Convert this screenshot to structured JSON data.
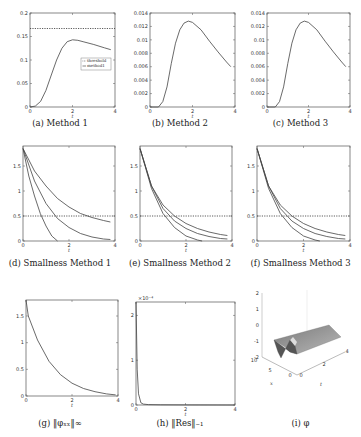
{
  "figure": {
    "panels": [
      {
        "id": "a",
        "caption": "(a) Method 1"
      },
      {
        "id": "b",
        "caption": "(b) Method 2"
      },
      {
        "id": "c",
        "caption": "(c) Method 3"
      },
      {
        "id": "d",
        "caption": "(d) Smallness Method 1"
      },
      {
        "id": "e",
        "caption": "(e) Smallness Method 2"
      },
      {
        "id": "f",
        "caption": "(f) Smallness Method 3"
      },
      {
        "id": "g",
        "caption": "(g) ‖φₓₓ‖∞"
      },
      {
        "id": "h",
        "caption": "(h) ‖Res‖₋₁"
      },
      {
        "id": "i",
        "caption": "(i) φ"
      }
    ]
  },
  "chart_data": [
    {
      "id": "a",
      "type": "line",
      "title": "Method 1",
      "xlabel": "t",
      "ylabel": "",
      "xlim": [
        0,
        4
      ],
      "ylim": [
        0,
        0.2
      ],
      "xticks": [
        "0",
        "2",
        "4"
      ],
      "yticks": [
        "0",
        "0.05",
        "0.1",
        "0.15",
        "0.2"
      ],
      "legend": {
        "entries": [
          "threshold",
          "method1"
        ],
        "position": "center-right"
      },
      "series": [
        {
          "name": "threshold",
          "style": "dotted",
          "x": [
            0,
            4
          ],
          "y": [
            0.167,
            0.167
          ]
        },
        {
          "name": "method1",
          "style": "solid",
          "x": [
            0,
            0.25,
            0.5,
            0.75,
            1.0,
            1.25,
            1.5,
            1.75,
            2.0,
            2.25,
            2.5,
            3.0,
            3.5,
            3.8
          ],
          "y": [
            0,
            0.002,
            0.012,
            0.035,
            0.068,
            0.1,
            0.125,
            0.139,
            0.143,
            0.142,
            0.139,
            0.133,
            0.126,
            0.122
          ]
        }
      ]
    },
    {
      "id": "b",
      "type": "line",
      "title": "Method 2",
      "xlabel": "t",
      "ylabel": "",
      "xlim": [
        0,
        4
      ],
      "ylim": [
        0,
        0.014
      ],
      "xticks": [
        "0",
        "2",
        "4"
      ],
      "yticks": [
        "0",
        "0.002",
        "0.004",
        "0.006",
        "0.008",
        "0.01",
        "0.012",
        "0.014"
      ],
      "series": [
        {
          "name": "method2",
          "style": "solid",
          "x": [
            0,
            0.4,
            0.6,
            0.8,
            1.0,
            1.2,
            1.4,
            1.6,
            1.8,
            2.0,
            2.4,
            2.8,
            3.2,
            3.6,
            3.8
          ],
          "y": [
            0,
            0,
            0.0008,
            0.003,
            0.0065,
            0.0095,
            0.0115,
            0.0125,
            0.0128,
            0.0126,
            0.0115,
            0.0098,
            0.0082,
            0.0067,
            0.006
          ]
        }
      ]
    },
    {
      "id": "c",
      "type": "line",
      "title": "Method 3",
      "xlabel": "t",
      "ylabel": "",
      "xlim": [
        0,
        4
      ],
      "ylim": [
        0,
        0.014
      ],
      "xticks": [
        "0",
        "2",
        "4"
      ],
      "yticks": [
        "0",
        "0.002",
        "0.004",
        "0.006",
        "0.008",
        "0.01",
        "0.012",
        "0.014"
      ],
      "series": [
        {
          "name": "method3",
          "style": "solid",
          "x": [
            0,
            0.4,
            0.6,
            0.8,
            1.0,
            1.2,
            1.4,
            1.6,
            1.8,
            2.0,
            2.4,
            2.8,
            3.2,
            3.6,
            3.8
          ],
          "y": [
            0,
            0,
            0.0008,
            0.003,
            0.0065,
            0.0095,
            0.0115,
            0.0125,
            0.0128,
            0.0126,
            0.0115,
            0.0098,
            0.0082,
            0.0067,
            0.006
          ]
        }
      ]
    },
    {
      "id": "d",
      "type": "line",
      "title": "Smallness Method 1",
      "xlabel": "t",
      "ylabel": "",
      "xlim": [
        0,
        4
      ],
      "ylim": [
        0,
        1.9
      ],
      "xticks": [
        "0",
        "2",
        "4"
      ],
      "yticks": [
        "0",
        "0.5",
        "1",
        "1.5"
      ],
      "series": [
        {
          "name": "threshold",
          "style": "dotted",
          "x": [
            0,
            4
          ],
          "y": [
            0.5,
            0.5
          ]
        },
        {
          "name": "curve1",
          "style": "solid",
          "x": [
            0,
            0.25,
            0.5,
            0.75,
            1.0,
            1.25,
            1.5
          ],
          "y": [
            1.85,
            1.3,
            0.9,
            0.55,
            0.3,
            0.1,
            0
          ]
        },
        {
          "name": "curve2",
          "style": "solid",
          "x": [
            0,
            0.5,
            1.0,
            1.5,
            2.0,
            2.5,
            3.0,
            3.5,
            3.8
          ],
          "y": [
            1.85,
            1.2,
            0.75,
            0.45,
            0.27,
            0.15,
            0.08,
            0.04,
            0.03
          ]
        },
        {
          "name": "curve3",
          "style": "solid",
          "x": [
            0,
            0.5,
            1.0,
            1.5,
            2.0,
            2.5,
            3.0,
            3.5,
            3.8
          ],
          "y": [
            1.85,
            1.4,
            1.1,
            0.85,
            0.68,
            0.55,
            0.47,
            0.41,
            0.38
          ]
        }
      ]
    },
    {
      "id": "e",
      "type": "line",
      "title": "Smallness Method 2",
      "xlabel": "t",
      "ylabel": "",
      "xlim": [
        0,
        4
      ],
      "ylim": [
        0,
        1.9
      ],
      "xticks": [
        "0",
        "2",
        "4"
      ],
      "yticks": [
        "0",
        "0.5",
        "1",
        "1.5"
      ],
      "series": [
        {
          "name": "threshold",
          "style": "dotted",
          "x": [
            0,
            4
          ],
          "y": [
            0.5,
            0.5
          ]
        },
        {
          "name": "curve1",
          "style": "solid",
          "x": [
            0,
            0.5,
            1.0,
            1.5,
            2.0,
            2.5,
            2.7
          ],
          "y": [
            1.85,
            1.05,
            0.55,
            0.27,
            0.1,
            0.02,
            0
          ]
        },
        {
          "name": "curve2",
          "style": "solid",
          "x": [
            0,
            0.5,
            1.0,
            1.5,
            2.0,
            2.5,
            3.0,
            3.5,
            3.8
          ],
          "y": [
            1.85,
            1.1,
            0.65,
            0.4,
            0.25,
            0.15,
            0.09,
            0.05,
            0.04
          ]
        },
        {
          "name": "curve3",
          "style": "solid",
          "x": [
            0,
            0.5,
            1.0,
            1.5,
            2.0,
            2.5,
            3.0,
            3.5,
            3.8
          ],
          "y": [
            1.85,
            1.1,
            0.72,
            0.5,
            0.35,
            0.25,
            0.18,
            0.13,
            0.11
          ]
        }
      ]
    },
    {
      "id": "f",
      "type": "line",
      "title": "Smallness Method 3",
      "xlabel": "t",
      "ylabel": "",
      "xlim": [
        0,
        4
      ],
      "ylim": [
        0,
        1.9
      ],
      "xticks": [
        "0",
        "2",
        "4"
      ],
      "yticks": [
        "0",
        "0.5",
        "1",
        "1.5"
      ],
      "series": [
        {
          "name": "threshold",
          "style": "dotted",
          "x": [
            0,
            4
          ],
          "y": [
            0.5,
            0.5
          ]
        },
        {
          "name": "curve1",
          "style": "solid",
          "x": [
            0,
            0.5,
            1.0,
            1.5,
            2.0,
            2.5,
            2.7
          ],
          "y": [
            1.85,
            1.05,
            0.55,
            0.27,
            0.1,
            0.02,
            0
          ]
        },
        {
          "name": "curve2",
          "style": "solid",
          "x": [
            0,
            0.5,
            1.0,
            1.5,
            2.0,
            2.5,
            3.0,
            3.5,
            3.8
          ],
          "y": [
            1.85,
            1.1,
            0.65,
            0.4,
            0.25,
            0.15,
            0.09,
            0.05,
            0.04
          ]
        },
        {
          "name": "curve3",
          "style": "solid",
          "x": [
            0,
            0.5,
            1.0,
            1.5,
            2.0,
            2.5,
            3.0,
            3.5,
            3.8
          ],
          "y": [
            1.85,
            1.1,
            0.72,
            0.5,
            0.35,
            0.25,
            0.18,
            0.13,
            0.11
          ]
        }
      ]
    },
    {
      "id": "g",
      "type": "line",
      "title": "||phi_xx||_inf",
      "xlabel": "t",
      "ylabel": "",
      "xlim": [
        0,
        4
      ],
      "ylim": [
        0,
        1.8
      ],
      "xticks": [
        "0",
        "2",
        "4"
      ],
      "yticks": [
        "0",
        "0.5",
        "1",
        "1.5"
      ],
      "series": [
        {
          "name": "phi_xx_inf",
          "style": "solid",
          "x": [
            0,
            0.1,
            0.5,
            1.0,
            1.5,
            2.0,
            2.5,
            3.0,
            3.5,
            3.9
          ],
          "y": [
            1.8,
            1.5,
            1.05,
            0.65,
            0.4,
            0.24,
            0.14,
            0.08,
            0.04,
            0.02
          ]
        }
      ]
    },
    {
      "id": "h",
      "type": "line",
      "title": "||Res||_-1",
      "xlabel": "t",
      "ylabel": "",
      "xlim": [
        0,
        4
      ],
      "ylim": [
        0,
        2.3
      ],
      "yscale_note": "×10⁻⁴",
      "xticks": [
        "0",
        "2",
        "4"
      ],
      "yticks": [
        "0",
        "1",
        "2"
      ],
      "series": [
        {
          "name": "res",
          "style": "solid",
          "x": [
            0,
            0.05,
            0.1,
            0.2,
            0.3,
            0.5,
            1.0,
            2.0,
            4.0
          ],
          "y": [
            2.3,
            0.8,
            0.25,
            0.05,
            0.02,
            0.01,
            0.005,
            0.002,
            0.001
          ]
        }
      ]
    },
    {
      "id": "i",
      "type": "surface",
      "title": "phi",
      "xlabel": "t",
      "ylabel": "x",
      "zlabel": "",
      "xlim": [
        0,
        4
      ],
      "ylim": [
        0,
        10
      ],
      "zlim": [
        -2,
        2
      ],
      "xticks": [
        "0",
        "2",
        "4"
      ],
      "yticks": [
        "0",
        "5",
        "10"
      ],
      "zticks": [
        "-2",
        "-1",
        "0",
        "1",
        "2"
      ]
    }
  ]
}
